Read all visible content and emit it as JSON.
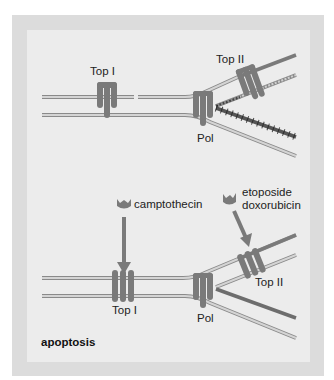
{
  "figure": {
    "colors": {
      "background": "#ffffff",
      "frame": "#dcdcdc",
      "panel": "#ececec",
      "protein": "#7a7a7a",
      "strand_fill": "#cfcfcf",
      "strand_edge": "#8a8a8a",
      "new_strand": "#7a7a7a",
      "arrow": "#7a7a7a",
      "text": "#222222"
    },
    "top_panel": {
      "top1_label": "Top I",
      "top2_label": "Top II",
      "pol_label": "Pol"
    },
    "bottom_panel": {
      "drug1_label": "camptothecin",
      "drug2_label_line1": "etoposide",
      "drug2_label_line2": "doxorubicin",
      "top1_label": "Top I",
      "top2_label": "Top II",
      "pol_label": "Pol",
      "outcome_label": "apoptosis"
    }
  }
}
